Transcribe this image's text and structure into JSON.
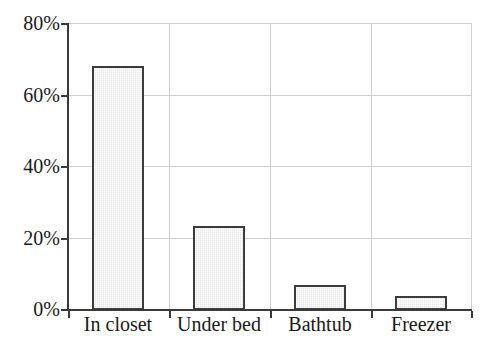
{
  "chart_data": {
    "type": "bar",
    "title": "",
    "subtitle": "",
    "xlabel": "",
    "ylabel": "",
    "categories": [
      "In closet",
      "Under bed",
      "Bathtub",
      "Freezer"
    ],
    "values": [
      68,
      23.5,
      7,
      4
    ],
    "value_unit": "%",
    "ylim": [
      0,
      80
    ],
    "ytick_values": [
      0,
      20,
      40,
      60,
      80
    ],
    "ytick_labels": [
      "0%",
      "20%",
      "40%",
      "60%",
      "80%"
    ],
    "grid": true,
    "grid_axis": "both",
    "legend": false,
    "legend_position": "none",
    "series": [
      {
        "name": "",
        "values": [
          68,
          23.5,
          7,
          4
        ]
      }
    ],
    "colors": {
      "bar_fill": "#e9e9e9",
      "bar_edge": "#3c3c3c",
      "axis": "#3a3a3a",
      "grid": "#cfcfcf",
      "text": "#1a1a1a",
      "background": "#ffffff"
    }
  },
  "axis": {
    "y": {
      "ticks": [
        {
          "label": "80%",
          "value": 80
        },
        {
          "label": "60%",
          "value": 60
        },
        {
          "label": "40%",
          "value": 40
        },
        {
          "label": "20%",
          "value": 20
        },
        {
          "label": "0%",
          "value": 0
        }
      ]
    },
    "x": {
      "ticks": [
        {
          "label": "In closet"
        },
        {
          "label": "Under bed"
        },
        {
          "label": "Bathtub"
        },
        {
          "label": "Freezer"
        }
      ]
    }
  }
}
